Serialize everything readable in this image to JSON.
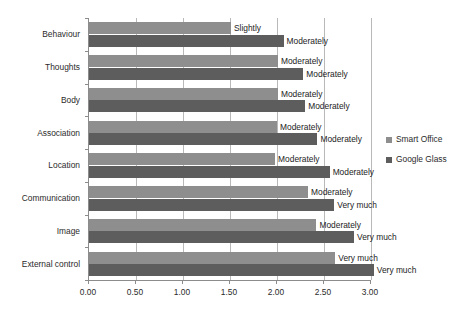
{
  "chart_data": {
    "type": "bar",
    "orientation": "horizontal",
    "title": "",
    "xlabel": "",
    "ylabel": "",
    "xlim": [
      0.0,
      3.0
    ],
    "xticks": [
      "0.00",
      "0.50",
      "1.00",
      "1.50",
      "2.00",
      "2.50",
      "3.00"
    ],
    "grid": true,
    "legend_position": "right",
    "categories": [
      "Behaviour",
      "Thoughts",
      "Body",
      "Association",
      "Location",
      "Communication",
      "Image",
      "External control"
    ],
    "series": [
      {
        "name": "Smart Office",
        "color": "#8e8e8e",
        "values": [
          1.51,
          2.01,
          2.01,
          2.0,
          1.98,
          2.33,
          2.42,
          2.62
        ],
        "point_labels": [
          "Slightly",
          "Moderately",
          "Moderately",
          "Moderately",
          "Moderately",
          "Moderately",
          "Moderately",
          "Very much"
        ]
      },
      {
        "name": "Google Glass",
        "color": "#5d5d5d",
        "values": [
          2.07,
          2.28,
          2.3,
          2.43,
          2.56,
          2.61,
          2.82,
          3.03
        ],
        "point_labels": [
          "Moderately",
          "Moderately",
          "Moderately",
          "Moderately",
          "Moderately",
          "Very much",
          "Very much",
          "Very much"
        ]
      }
    ]
  },
  "legend": {
    "items": [
      {
        "label": "Smart Office",
        "color": "#8e8e8e"
      },
      {
        "label": "Google Glass",
        "color": "#5d5d5d"
      }
    ]
  }
}
